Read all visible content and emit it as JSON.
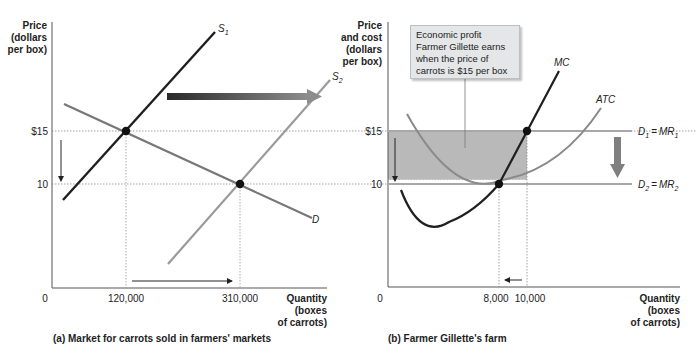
{
  "panel_a": {
    "y_axis_label": [
      "Price",
      "(dollars",
      "per box)"
    ],
    "x_axis_label": [
      "Quantity",
      "(boxes",
      "of carrots)"
    ],
    "y_ticks": [
      "$15",
      "10"
    ],
    "x_ticks": [
      "0",
      "120,000",
      "310,000"
    ],
    "curves": {
      "supply1": "S",
      "supply1_sub": "1",
      "supply2": "S",
      "supply2_sub": "2",
      "demand": "D"
    },
    "caption": "(a) Market for carrots sold in farmers' markets",
    "equilibria": [
      {
        "price": 15,
        "quantity": 120000
      },
      {
        "price": 10,
        "quantity": 310000
      }
    ]
  },
  "panel_b": {
    "y_axis_label": [
      "Price",
      "and cost",
      "(dollars",
      "per box)"
    ],
    "x_axis_label": [
      "Quantity",
      "(boxes",
      "of carrots)"
    ],
    "y_ticks": [
      "$15",
      "10"
    ],
    "x_ticks": [
      "0",
      "8,000",
      "10,000"
    ],
    "curves": {
      "mc": "MC",
      "atc": "ATC",
      "d1": "D",
      "d1_sub": "1",
      "mr1": "MR",
      "mr1_sub": "1",
      "d2": "D",
      "d2_sub": "2",
      "mr2": "MR",
      "mr2_sub": "2",
      "eq": "="
    },
    "callout": "Economic profit Farmer Gillette earns when the price of carrots is $15 per box",
    "caption": "(b) Farmer Gillette's farm",
    "points": [
      {
        "price": 15,
        "quantity": 10000
      },
      {
        "price": 10,
        "quantity": 8000
      }
    ]
  },
  "colors": {
    "dark_line": "#1f1f1f",
    "gray_line": "#8a8a8a",
    "light_gray": "#a8a8a8",
    "shade": "#b9b9b9",
    "arrow_gray": "#7f7f7f"
  }
}
